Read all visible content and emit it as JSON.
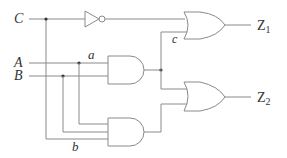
{
  "diagram": {
    "type": "logic-circuit",
    "inputs": [
      {
        "name": "C",
        "label": "C"
      },
      {
        "name": "A",
        "label": "A"
      },
      {
        "name": "B",
        "label": "B"
      }
    ],
    "wire_labels": {
      "a": "a",
      "b": "b",
      "c": "c"
    },
    "outputs": [
      {
        "name": "Z1",
        "main": "Z",
        "sub": "1"
      },
      {
        "name": "Z2",
        "main": "Z",
        "sub": "2"
      }
    ],
    "gates": [
      {
        "id": "not1",
        "kind": "NOT",
        "inputs": [
          "C"
        ]
      },
      {
        "id": "and1",
        "kind": "AND",
        "inputs": [
          "A",
          "B"
        ]
      },
      {
        "id": "and2",
        "kind": "AND",
        "inputs": [
          "A",
          "B",
          "C"
        ]
      },
      {
        "id": "or1",
        "kind": "OR",
        "inputs": [
          "not1",
          "and1"
        ],
        "output": "Z1"
      },
      {
        "id": "or2",
        "kind": "OR",
        "inputs": [
          "and1",
          "and2"
        ],
        "output": "Z2"
      }
    ],
    "colors": {
      "wire": "#8a8a8a",
      "junction": "#333333",
      "text": "#333333"
    }
  }
}
